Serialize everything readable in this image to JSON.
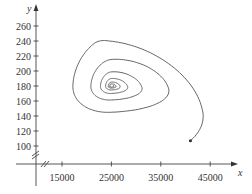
{
  "chart_data": {
    "type": "line",
    "title": "",
    "xlabel": "x",
    "ylabel": "y",
    "xlim": [
      9000,
      50000
    ],
    "ylim": [
      70,
      280
    ],
    "x_ticks": [
      15000,
      25000,
      35000,
      45000
    ],
    "y_ticks": [
      100,
      120,
      140,
      160,
      180,
      200,
      220,
      240,
      260
    ],
    "x_tick_labels": [
      "15000",
      "25000",
      "35000",
      "45000"
    ],
    "y_tick_labels": [
      "100",
      "120",
      "140",
      "160",
      "180",
      "200",
      "220",
      "240",
      "260"
    ],
    "grid": false,
    "legend": null,
    "axis_breaks": [
      "x-axis near origin",
      "y-axis near origin"
    ],
    "series": [
      {
        "name": "phase trajectory",
        "description": "Spiral trajectory starting near (41000, 107) moving counterclockwise and converging to equilibrium near (25000, 180)",
        "start_point": [
          41000,
          107
        ],
        "equilibrium": [
          25000,
          180
        ],
        "outer_extent": {
          "x_min": 13500,
          "x_max": 47000,
          "y_min": 120,
          "y_max": 261
        }
      }
    ]
  }
}
